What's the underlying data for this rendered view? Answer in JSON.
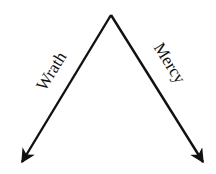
{
  "diagram": {
    "apex": {
      "x": 111,
      "y": 15
    },
    "arrows": [
      {
        "id": "left",
        "label": "Wrath",
        "to": {
          "x": 21,
          "y": 163
        }
      },
      {
        "id": "right",
        "label": "Mercy",
        "to": {
          "x": 204,
          "y": 163
        }
      }
    ],
    "colors": {
      "line": "#111111",
      "background": "#ffffff"
    }
  }
}
